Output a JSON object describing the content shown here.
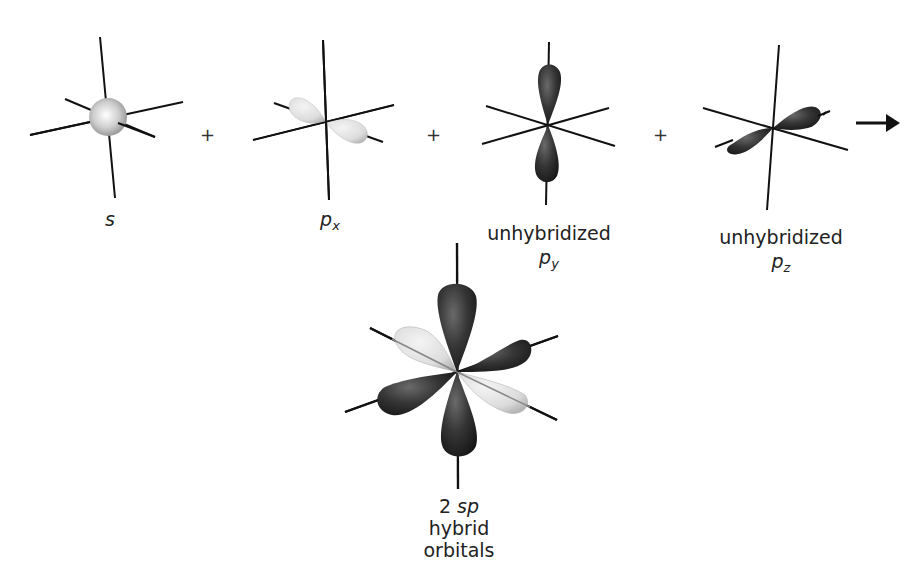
{
  "figure": {
    "terms": [
      {
        "id": "s",
        "symbol": "s",
        "subscript": "",
        "caption": ""
      },
      {
        "id": "px",
        "symbol": "p",
        "subscript": "x",
        "caption": ""
      },
      {
        "id": "py",
        "symbol": "p",
        "subscript": "y",
        "caption": "unhybridized"
      },
      {
        "id": "pz",
        "symbol": "p",
        "subscript": "z",
        "caption": "unhybridized"
      }
    ],
    "operators": [
      "+",
      "+",
      "+"
    ],
    "arrow": "→",
    "result": {
      "count": "2",
      "symbol": "sp",
      "caption": "hybrid orbitals"
    },
    "colors": {
      "axis": "#111111",
      "s_orbital": "#c8c8c8",
      "hybrid_lobe": "#e0e0e0",
      "unhybridized_lobe": "#2c2c2c"
    }
  }
}
